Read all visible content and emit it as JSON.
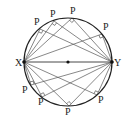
{
  "diagram": {
    "type": "geometry",
    "circle": {
      "cx": 68,
      "cy": 62,
      "r": 44,
      "stroke": "#222222"
    },
    "center_dot": {
      "x": 68,
      "y": 62
    },
    "endpoints": [
      {
        "name": "X",
        "label": "X",
        "x": 24,
        "y": 62,
        "lx": 15,
        "ly": 66
      },
      {
        "name": "Y",
        "label": "Y",
        "x": 112,
        "y": 62,
        "lx": 114,
        "ly": 66
      }
    ],
    "points": [
      {
        "label": "P",
        "x": 40,
        "y": 29,
        "lx": 34,
        "ly": 25
      },
      {
        "label": "P",
        "x": 54,
        "y": 21,
        "lx": 50,
        "ly": 17
      },
      {
        "label": "P",
        "x": 72,
        "y": 18,
        "lx": 70,
        "ly": 14
      },
      {
        "label": "P",
        "x": 102,
        "y": 34,
        "lx": 103,
        "ly": 30
      },
      {
        "label": "P",
        "x": 31,
        "y": 85,
        "lx": 22,
        "ly": 93
      },
      {
        "label": "P",
        "x": 42,
        "y": 97,
        "lx": 38,
        "ly": 105
      },
      {
        "label": "P",
        "x": 69,
        "y": 106,
        "lx": 65,
        "ly": 115
      },
      {
        "label": "P",
        "x": 97,
        "y": 95,
        "lx": 98,
        "ly": 103
      }
    ],
    "line_color": "#555555"
  }
}
